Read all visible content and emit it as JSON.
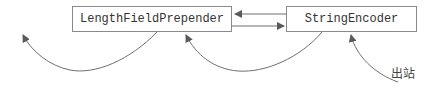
{
  "diagram": {
    "nodes": [
      {
        "id": "lfp",
        "label": "LengthFieldPrepender"
      },
      {
        "id": "se",
        "label": "StringEncoder"
      }
    ],
    "edges": [
      {
        "from": "se",
        "to": "lfp",
        "type": "straight-arrow"
      },
      {
        "from": "lfp",
        "to": "se",
        "type": "straight-arrow"
      },
      {
        "from": "outbound",
        "to": "se",
        "type": "curved-arrow"
      },
      {
        "from": "se",
        "to": "lfp",
        "type": "curved-arrow"
      },
      {
        "from": "lfp",
        "to": "outside-left",
        "type": "curved-arrow"
      }
    ],
    "outbound_label": "出站"
  },
  "colors": {
    "stroke": "#6f6f6f",
    "box_border": "#8a8a8a",
    "text": "#333333"
  }
}
